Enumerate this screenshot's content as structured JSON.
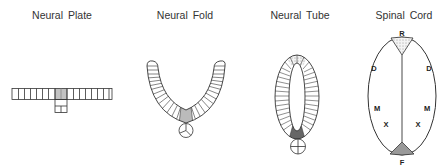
{
  "stages": [
    {
      "id": "neural-plate",
      "title": "Neural Plate",
      "x": 62
    },
    {
      "id": "neural-fold",
      "title": "Neural Fold",
      "x": 185
    },
    {
      "id": "neural-tube",
      "title": "Neural Tube",
      "x": 300
    },
    {
      "id": "spinal-cord",
      "title": "Spinal Cord",
      "x": 404
    }
  ],
  "spinal_cord_labels": {
    "roof": "R",
    "dorsal_left": "D",
    "dorsal_right": "D",
    "motor_left": "M",
    "motor_right": "M",
    "x_left": "X",
    "x_right": "X",
    "floor": "F",
    "notochord": "N"
  },
  "colors": {
    "line": "#333333",
    "floor_plate_light": "#b8b8b8",
    "floor_plate_dark": "#707070",
    "roof_plate_stipple": "#f0f0f0"
  }
}
